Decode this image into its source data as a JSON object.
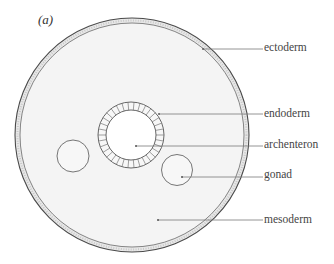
{
  "figure": {
    "panel_label": "(a)",
    "colors": {
      "background": "#ffffff",
      "mesoderm_fill": "#f3f3f3",
      "ectoderm_band": "#e6e6e6",
      "outline": "#555555",
      "archenteron_fill": "#ffffff"
    }
  },
  "labels": {
    "ectoderm": "ectoderm",
    "endoderm": "endoderm",
    "archenteron": "archenteron",
    "gonad": "gonad",
    "mesoderm": "mesoderm"
  }
}
